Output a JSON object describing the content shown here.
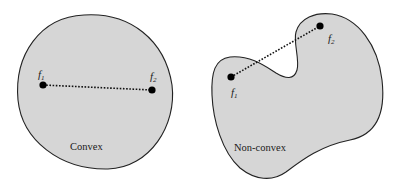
{
  "figure": {
    "colors": {
      "background": "#ffffff",
      "fill": "#d6d6d6",
      "stroke": "#222222",
      "point": "#000000"
    },
    "panels": [
      {
        "id": "convex",
        "caption": "Convex",
        "points": [
          {
            "label": "f",
            "subscript": "1",
            "x": 43,
            "y": 85
          },
          {
            "label": "f",
            "subscript": "2",
            "x": 152,
            "y": 90
          }
        ],
        "segment": "dotted",
        "segment_inside_shape": true
      },
      {
        "id": "non-convex",
        "caption": "Non-convex",
        "points": [
          {
            "label": "f",
            "subscript": "1",
            "x": 231,
            "y": 77
          },
          {
            "label": "f",
            "subscript": "2",
            "x": 320,
            "y": 26
          }
        ],
        "segment": "dotted",
        "segment_inside_shape": false
      }
    ]
  }
}
